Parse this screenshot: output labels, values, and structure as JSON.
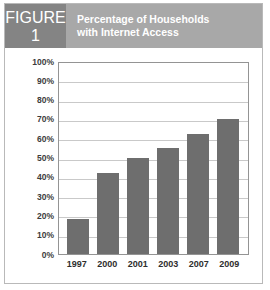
{
  "figure": {
    "badge_word": "FIGURE",
    "badge_number": "1",
    "title_line_1": "Percentage of Households",
    "title_line_2": "with Internet Access",
    "header_bg": "#a8a8a8",
    "badge_bg": "#848484",
    "header_text_color": "#ffffff",
    "border_color": "#b9b9b9"
  },
  "chart_data": {
    "type": "bar",
    "title": "Percentage of Households with Internet Access",
    "xlabel": "",
    "ylabel": "",
    "categories": [
      "1997",
      "2000",
      "2001",
      "2003",
      "2007",
      "2009"
    ],
    "values": [
      18,
      42,
      50,
      55,
      62,
      70
    ],
    "ylim": [
      0,
      100
    ],
    "ytick_labels": [
      "100%",
      "90%",
      "80%",
      "70%",
      "60%",
      "50%",
      "40%",
      "30%",
      "20%",
      "10%",
      "0%"
    ],
    "ytick_values": [
      100,
      90,
      80,
      70,
      60,
      50,
      40,
      30,
      20,
      10,
      0
    ],
    "grid": true,
    "legend": "none",
    "bar_color": "#6e6e6e",
    "gridline_color": "#c9c9c9",
    "axis_color": "#949494",
    "plot_background": "#ffffff"
  }
}
